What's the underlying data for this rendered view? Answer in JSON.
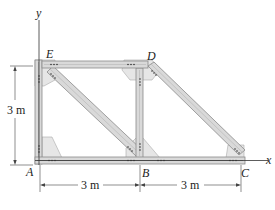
{
  "diagram": {
    "type": "truss",
    "joints": [
      {
        "id": "A",
        "label": "A"
      },
      {
        "id": "B",
        "label": "B"
      },
      {
        "id": "C",
        "label": "C"
      },
      {
        "id": "D",
        "label": "D"
      },
      {
        "id": "E",
        "label": "E"
      }
    ],
    "members": [
      "AB",
      "BC",
      "AE",
      "ED",
      "BD",
      "EB",
      "DC"
    ],
    "axes": {
      "x_label": "x",
      "y_label": "y"
    },
    "dimensions": {
      "height": "3 m",
      "span_AB": "3 m",
      "span_BC": "3 m"
    },
    "colors": {
      "member_fill": "#d9d9d9",
      "member_edge": "#8a8a8a",
      "gusset": "#e4e4e4",
      "line": "#333333"
    }
  }
}
